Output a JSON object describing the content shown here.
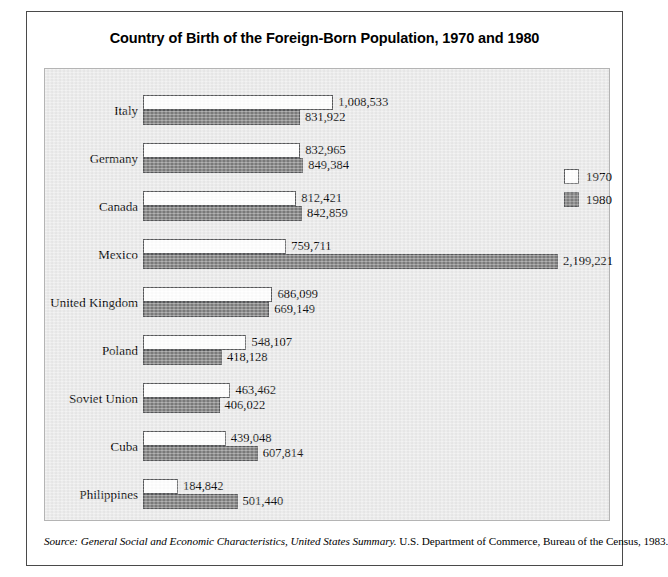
{
  "title": "Country of Birth of the Foreign-Born Population, 1970 and 1980",
  "source": {
    "prefix_italic": "Source: General Social and Economic Characteristics, United States Summary.",
    "suffix_roman": " U.S. Department of Commerce, Bureau of the Census, 1983."
  },
  "legend": {
    "position": "top-right",
    "entries": [
      {
        "label": "1970",
        "color": "#ffffff"
      },
      {
        "label": "1980",
        "color": "#808080"
      }
    ]
  },
  "colors": {
    "series_1970": "#ffffff",
    "series_1980": "#808080",
    "bar_outline": "#58595b",
    "panel_background": "#ebebeb",
    "panel_border": "#b4b4b4",
    "frame_border": "#4a4a4a",
    "page_background": "#ffffff",
    "text": "#000000"
  },
  "chart_data": {
    "type": "bar",
    "orientation": "horizontal",
    "title": "Country of Birth of the Foreign-Born Population, 1970 and 1980",
    "xlabel": "",
    "ylabel": "",
    "grid": false,
    "legend_position": "top-right",
    "xlim": [
      0,
      2199221
    ],
    "categories": [
      "Italy",
      "Germany",
      "Canada",
      "Mexico",
      "United Kingdom",
      "Poland",
      "Soviet Union",
      "Cuba",
      "Philippines"
    ],
    "series": [
      {
        "name": "1970",
        "color": "#ffffff",
        "values": [
          1008533,
          832965,
          812421,
          759711,
          686099,
          548107,
          463462,
          439048,
          184842
        ],
        "labels": [
          "1,008,533",
          "832,965",
          "812,421",
          "759,711",
          "686,099",
          "548,107",
          "463,462",
          "439,048",
          "184,842"
        ]
      },
      {
        "name": "1980",
        "color": "#808080",
        "values": [
          831922,
          849384,
          842859,
          2199221,
          669149,
          418128,
          406022,
          607814,
          501440
        ],
        "labels": [
          "831,922",
          "849,384",
          "842,859",
          "2,199,221",
          "669,149",
          "418,128",
          "406,022",
          "607,814",
          "501,440"
        ]
      }
    ]
  }
}
